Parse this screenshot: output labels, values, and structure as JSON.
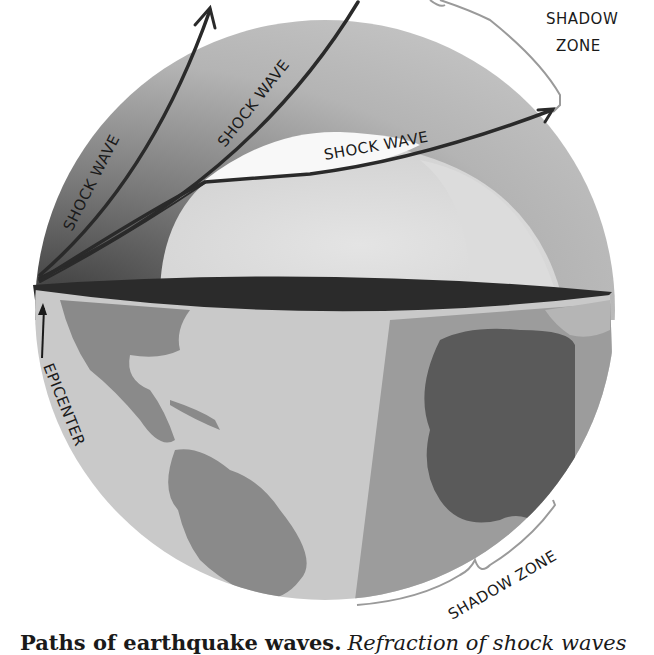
{
  "figure": {
    "type": "illustration",
    "labels": {
      "shock_wave_1": "SHOCK WAVE",
      "shock_wave_2": "SHOCK WAVE",
      "shock_wave_3": "SHOCK WAVE",
      "shadow_zone_top_line1": "SHADOW",
      "shadow_zone_top_line2": "ZONE",
      "shadow_zone_bottom": "SHADOW ZONE",
      "epicenter": "EPICENTER"
    },
    "colors": {
      "background": "#ffffff",
      "mantle_dark": "#6e6e6e",
      "mantle_light": "#bdbdbd",
      "core": "#d6d6d6",
      "inner_clear": "#f7f7f7",
      "crust_band": "#2b2b2b",
      "ocean": "#c9c9c9",
      "land": "#8a8a8a",
      "land_dark": "#5a5a5a",
      "shadow_ocean": "#9c9c9c",
      "wave_line": "#2a2a2a",
      "bracket": "#9a9a9a",
      "text": "#1a1a1a"
    }
  },
  "caption": {
    "title": "Paths of earthquake waves.",
    "text": "Refraction of shock waves"
  }
}
